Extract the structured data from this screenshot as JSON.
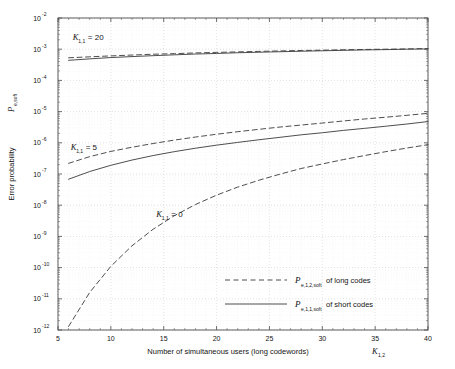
{
  "figure": {
    "background": "#ffffff",
    "plot_background": "#ffffff",
    "frame_color": "#4d4d4d",
    "grid_color": "#c9c9c9",
    "curve_color": "#3a3a3a"
  },
  "axes": {
    "y_title_main": "Error probability",
    "y_title_symbol": "P",
    "y_title_subscript": "e,soft",
    "x_title": "Number of simultaneous users  (long codewords)",
    "x_title_symbol": "K",
    "x_title_subscript": "1,2",
    "x_ticks": [
      "5",
      "10",
      "15",
      "20",
      "25",
      "30",
      "35",
      "40"
    ],
    "y_tick_mantissa": "10",
    "y_tick_exponents": [
      "-2",
      "-3",
      "-4",
      "-5",
      "-6",
      "-7",
      "-8",
      "-9",
      "-10",
      "-11",
      "-12"
    ]
  },
  "annotations": [
    {
      "symbol": "K",
      "subscript": "1,1",
      "text": "= 20",
      "x": 6.4,
      "y_log": -2.72
    },
    {
      "symbol": "K",
      "subscript": "1,1",
      "text": "= 5",
      "x": 6.2,
      "y_log": -6.22
    },
    {
      "symbol": "K",
      "subscript": "1,1",
      "text": "= 0",
      "x": 14.3,
      "y_log": -8.37
    }
  ],
  "legend": {
    "entries": [
      {
        "style": "dashed",
        "symbol": "P",
        "subscript": "e,1,2,soft",
        "text": "of long codes"
      },
      {
        "style": "solid",
        "symbol": "P",
        "subscript": "e,1,1,soft",
        "text": "of short codes"
      }
    ]
  },
  "chart_data": {
    "type": "line",
    "title": "",
    "xlabel": "Number of simultaneous users  (long codewords) K_{1,2}",
    "ylabel": "Error probability P_{e,soft}",
    "xscale": "linear",
    "yscale": "log",
    "xlim": [
      5,
      40
    ],
    "ylim": [
      1e-12,
      0.01
    ],
    "grid": true,
    "grid_minor": true,
    "legend_position": "lower right",
    "x": [
      6,
      8,
      10,
      12,
      14,
      16,
      18,
      20,
      22,
      24,
      26,
      28,
      30,
      32,
      34,
      36,
      38,
      40
    ],
    "series": [
      {
        "name": "P_e,1,2,soft of long codes (K_1,1 = 20)",
        "style": "dashed",
        "group": "K_1,1 = 20",
        "values": [
          0.00053,
          0.00057,
          0.00061,
          0.00065,
          0.00069,
          0.00072,
          0.00076,
          0.00079,
          0.00082,
          0.00085,
          0.00088,
          0.00091,
          0.00093,
          0.00096,
          0.00098,
          0.001,
          0.00102,
          0.00105
        ]
      },
      {
        "name": "P_e,1,1,soft of short codes (K_1,1 = 20)",
        "style": "solid",
        "group": "K_1,1 = 20",
        "values": [
          0.00044,
          0.00049,
          0.00054,
          0.00058,
          0.00062,
          0.00066,
          0.0007,
          0.00073,
          0.00077,
          0.0008,
          0.00083,
          0.00086,
          0.00089,
          0.00092,
          0.00095,
          0.00097,
          0.001,
          0.00102
        ]
      },
      {
        "name": "P_e,1,2,soft of long codes (K_1,1 = 5)",
        "style": "dashed",
        "group": "K_1,1 = 5",
        "values": [
          2.2e-07,
          3.6e-07,
          5.3e-07,
          7.2e-07,
          9.5e-07,
          1.22e-06,
          1.53e-06,
          1.88e-06,
          2.27e-06,
          2.7e-06,
          3.2e-06,
          3.7e-06,
          4.3e-06,
          5e-06,
          5.8e-06,
          6.6e-06,
          7.6e-06,
          8.8e-06
        ]
      },
      {
        "name": "P_e,1,1,soft of short codes (K_1,1 = 5)",
        "style": "solid",
        "group": "K_1,1 = 5",
        "values": [
          6.8e-08,
          1.2e-07,
          1.9e-07,
          2.8e-07,
          3.9e-07,
          5.2e-07,
          6.7e-07,
          8.4e-07,
          1.03e-06,
          1.25e-06,
          1.5e-06,
          1.8e-06,
          2.1e-06,
          2.5e-06,
          2.9e-06,
          3.4e-06,
          4e-06,
          4.8e-06
        ]
      },
      {
        "name": "P_e,1,2,soft of long codes (K_1,1 = 0)",
        "style": "dashed",
        "group": "K_1,1 = 0",
        "values": [
          1.3e-12,
          1.6e-11,
          1.1e-10,
          5e-10,
          1.7e-09,
          4.6e-09,
          1.05e-08,
          2.1e-08,
          3.8e-08,
          6.3e-08,
          9.9e-08,
          1.5e-07,
          2.1e-07,
          2.9e-07,
          3.9e-07,
          5.2e-07,
          6.8e-07,
          8.7e-07
        ]
      }
    ]
  }
}
